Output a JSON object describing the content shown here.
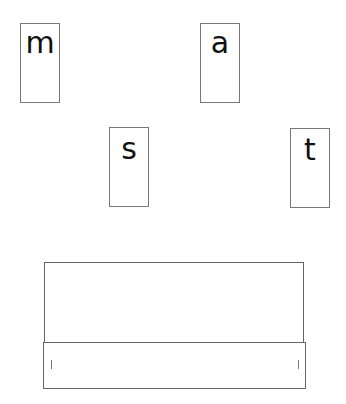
{
  "cards": [
    {
      "letter": "m",
      "x": 20,
      "y": 23
    },
    {
      "letter": "a",
      "x": 200,
      "y": 23
    },
    {
      "letter": "s",
      "x": 109,
      "y": 127
    },
    {
      "letter": "t",
      "x": 290,
      "y": 128
    }
  ],
  "word_box": {
    "left_mark": "l",
    "right_mark": "l"
  },
  "colors": {
    "border": "#777777",
    "text": "#111111"
  }
}
